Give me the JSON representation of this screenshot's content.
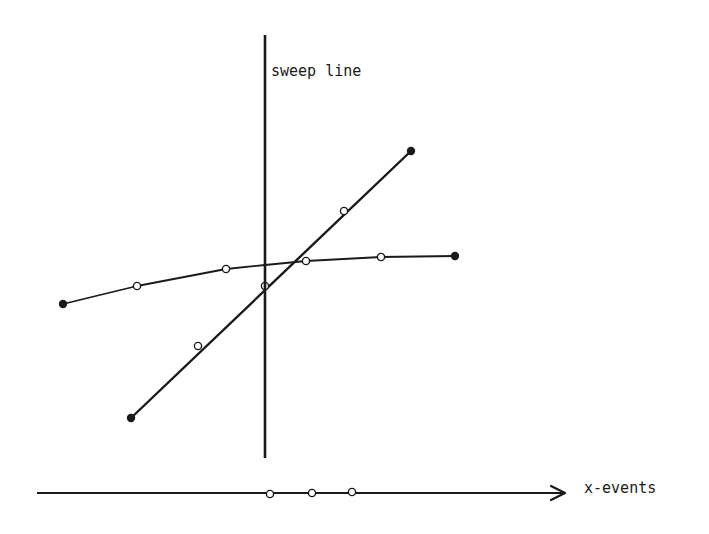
{
  "diagram": {
    "labels": {
      "sweep_line": "sweep line",
      "x_axis": "x-events"
    },
    "colors": {
      "ink": "#1a1a1a",
      "background": "#ffffff"
    },
    "sweep_line": {
      "x": 265,
      "y1": 35,
      "y2": 458,
      "width": 2.6
    },
    "x_axis": {
      "x1": 37,
      "x2": 565,
      "y": 493,
      "width": 2.2
    },
    "segments": [
      {
        "name": "curve-segment",
        "width": 1.8,
        "points": [
          [
            63,
            304
          ],
          [
            137,
            286
          ],
          [
            226,
            269
          ],
          [
            265,
            265
          ],
          [
            306,
            261
          ],
          [
            381,
            257
          ],
          [
            455,
            256
          ]
        ],
        "endpoints": [
          [
            63,
            304
          ],
          [
            455,
            256
          ]
        ],
        "markers": [
          [
            137,
            286
          ],
          [
            226,
            269
          ],
          [
            306,
            261
          ],
          [
            381,
            257
          ]
        ]
      },
      {
        "name": "diagonal-segment",
        "width": 2.4,
        "points": [
          [
            131,
            418
          ],
          [
            411,
            151
          ]
        ],
        "endpoints": [
          [
            131,
            418
          ],
          [
            411,
            151
          ]
        ],
        "markers": [
          [
            198,
            346
          ],
          [
            265,
            286
          ],
          [
            344,
            211
          ]
        ]
      }
    ],
    "x_event_markers": [
      [
        270,
        494
      ],
      [
        312,
        493
      ],
      [
        352,
        492
      ]
    ]
  }
}
